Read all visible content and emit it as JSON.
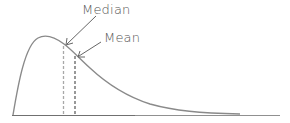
{
  "diagram": {
    "title": "",
    "type": "right-skewed distribution",
    "labels": {
      "median": "Median",
      "mean": "Mean"
    },
    "colors": {
      "curve": "#8a8a8a",
      "axis": "#707070",
      "median_line": "#a8a8a8",
      "mean_line": "#6e6e6e",
      "text": "#555555"
    }
  }
}
